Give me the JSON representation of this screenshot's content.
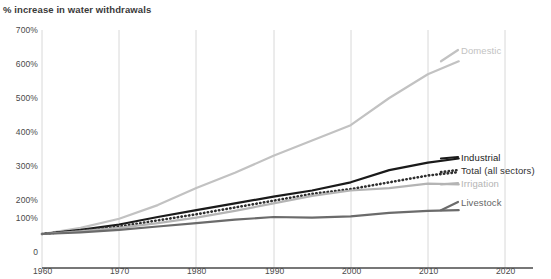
{
  "subtitle": "% increase in water withdrawals",
  "chart_data": {
    "type": "line",
    "title": "",
    "subtitle": "% increase in water withdrawals",
    "xlabel": "",
    "ylabel": "% increase in water withdrawals",
    "xlim": [
      1960,
      2020
    ],
    "ylim": [
      0,
      700
    ],
    "grid": "vertical gridlines at each decade",
    "legend_position": "right-of-plot inline labels at series end",
    "y_ticks": [
      "0",
      "100%",
      "200%",
      "300%",
      "400%",
      "500%",
      "600%",
      "700%"
    ],
    "y_tick_values": [
      0,
      100,
      200,
      300,
      400,
      500,
      600,
      700
    ],
    "x_ticks": [
      "1960",
      "1970",
      "1980",
      "1990",
      "2000",
      "2010",
      "2020"
    ],
    "x_tick_values": [
      1960,
      1970,
      1980,
      1990,
      2000,
      2010,
      2020
    ],
    "x": [
      1960,
      1965,
      1970,
      1975,
      1980,
      1985,
      1990,
      1995,
      2000,
      2005,
      2010,
      2014
    ],
    "series": [
      {
        "name": "Domestic",
        "label": "Domestic",
        "color": "#c2c2c2",
        "style": "solid",
        "values": [
          100,
          118,
          145,
          185,
          235,
          280,
          330,
          375,
          420,
          500,
          570,
          608
        ]
      },
      {
        "name": "Industrial",
        "label": "Industrial",
        "color": "#1a1a1a",
        "style": "solid",
        "values": [
          100,
          112,
          128,
          150,
          170,
          190,
          210,
          228,
          252,
          288,
          310,
          322
        ]
      },
      {
        "name": "Total (all sectors)",
        "label": "Total (all sectors)",
        "color": "#2f2f2f",
        "style": "dotted",
        "values": [
          100,
          110,
          122,
          140,
          158,
          178,
          198,
          218,
          232,
          252,
          272,
          282
        ]
      },
      {
        "name": "Irrigation",
        "label": "Irrigation",
        "color": "#b4b4b4",
        "style": "solid",
        "values": [
          100,
          108,
          118,
          132,
          148,
          168,
          190,
          212,
          228,
          235,
          248,
          246
        ]
      },
      {
        "name": "Livestock",
        "label": "Livestock",
        "color": "#6b6b6b",
        "style": "solid",
        "values": [
          100,
          105,
          112,
          122,
          132,
          142,
          150,
          148,
          152,
          162,
          168,
          170
        ]
      }
    ],
    "annotations": []
  }
}
